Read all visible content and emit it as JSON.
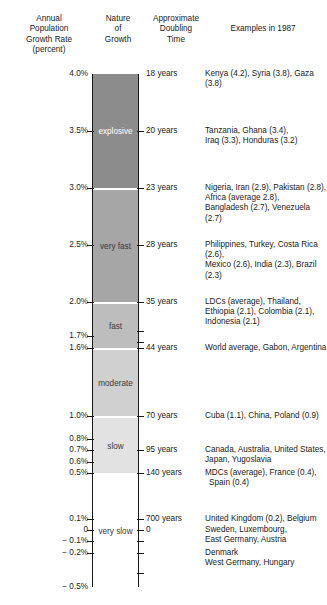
{
  "headers": {
    "rate": "Annual\nPopulation\nGrowth Rate\n(percent)",
    "rate_l1": "Annual",
    "rate_l2": "Population",
    "rate_l3": "Growth Rate",
    "rate_l4": "(percent)",
    "nature_l1": "Nature",
    "nature_l2": "of",
    "nature_l3": "Growth",
    "doubling_l1": "Approximate",
    "doubling_l2": "Doubling",
    "doubling_l3": "Time",
    "examples": "Examples in 1987"
  },
  "chart_data": {
    "type": "bar",
    "xlabel": "",
    "ylabel": "Annual Population Growth Rate (percent)",
    "ylim": [
      -0.5,
      4.0
    ],
    "grid": false,
    "legend": "none",
    "orientation": "vertical-scale",
    "axis_ticks_left": [
      {
        "value": 4.0,
        "label": "4.0%"
      },
      {
        "value": 3.5,
        "label": "3.5%"
      },
      {
        "value": 3.0,
        "label": "3.0%"
      },
      {
        "value": 2.5,
        "label": "2.5%"
      },
      {
        "value": 2.0,
        "label": "2.0%"
      },
      {
        "value": 1.7,
        "label": "1.7%"
      },
      {
        "value": 1.6,
        "label": "1.6%"
      },
      {
        "value": 1.0,
        "label": "1.0%"
      },
      {
        "value": 0.8,
        "label": "0.8%"
      },
      {
        "value": 0.7,
        "label": "0.7%"
      },
      {
        "value": 0.6,
        "label": "0.6%"
      },
      {
        "value": 0.5,
        "label": "0.5%"
      },
      {
        "value": 0.1,
        "label": "0.1%"
      },
      {
        "value": 0.0,
        "label": "0"
      },
      {
        "value": -0.1,
        "label": "− 0.1%"
      },
      {
        "value": -0.2,
        "label": "− 0.2%"
      },
      {
        "value": -0.5,
        "label": "− 0.5%"
      }
    ],
    "axis_ticks_right": [
      {
        "value": 4.0,
        "label": "18 years"
      },
      {
        "value": 3.5,
        "label": "20 years"
      },
      {
        "value": 3.0,
        "label": "23 years"
      },
      {
        "value": 2.5,
        "label": "28 years"
      },
      {
        "value": 2.0,
        "label": "35 years"
      },
      {
        "value": 1.6,
        "label": "44 years"
      },
      {
        "value": 1.0,
        "label": "70 years"
      },
      {
        "value": 0.7,
        "label": "95 years"
      },
      {
        "value": 0.5,
        "label": "140 years"
      },
      {
        "value": 0.1,
        "label": "700 years"
      },
      {
        "value": 0.0,
        "label": "0"
      }
    ],
    "bands": [
      {
        "name": "explosive",
        "from": 4.0,
        "to": 3.0,
        "color": "#8c8c8c"
      },
      {
        "name": "very fast",
        "from": 2.98,
        "to": 2.0,
        "color": "#a6a6a6"
      },
      {
        "name": "fast",
        "from": 1.98,
        "to": 1.6,
        "color": "#bdbdbd"
      },
      {
        "name": "moderate",
        "from": 1.58,
        "to": 1.0,
        "color": "#d0d0d0"
      },
      {
        "name": "slow",
        "from": 0.98,
        "to": 0.5,
        "color": "#e2e2e2"
      },
      {
        "name": "very slow",
        "from": 0.48,
        "to": -0.5,
        "color": "#ffffff"
      }
    ],
    "examples": [
      {
        "at": 4.0,
        "text": "Kenya (4.2), Syria (3.8), Gaza (3.8)"
      },
      {
        "at": 3.5,
        "text": "Tanzania, Ghana (3.4),\nIraq (3.3), Honduras (3.2)"
      },
      {
        "at": 3.0,
        "text": "Nigeria, Iran (2.9), Pakistan (2.8),\nAfrica (average 2.8),\nBangladesh (2.7), Venezuela (2.7)"
      },
      {
        "at": 2.5,
        "text": "Philippines, Turkey, Costa Rica (2.6),\nMexico (2.6), India (2.3), Brazil (2.3)"
      },
      {
        "at": 2.0,
        "text": "LDCs (average), Thailand,\nEthiopia (2.1), Colombia (2.1),\nIndonesia (2.1)"
      },
      {
        "at": 1.6,
        "text": "World average, Gabon, Argentina"
      },
      {
        "at": 1.0,
        "text": "Cuba (1.1), China, Poland (0.9)"
      },
      {
        "at": 0.7,
        "text": "Canada, Australia, United States,\nJapan, Yugoslavia"
      },
      {
        "at": 0.5,
        "text": "MDCs (average), France (0.4),\n Spain (0.4)"
      },
      {
        "at": 0.1,
        "text": "United Kingdom (0.2), Belgium"
      },
      {
        "at": 0.0,
        "text": "Sweden, Luxembourg,\nEast Germany, Austria"
      },
      {
        "at": -0.2,
        "text": "Denmark\nWest Germany, Hungary"
      }
    ]
  }
}
